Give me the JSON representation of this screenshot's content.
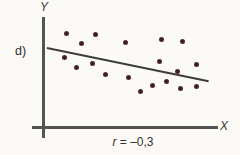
{
  "figure": {
    "panel_label": "d)",
    "y_axis_label": "Y",
    "x_axis_label": "X",
    "caption_variable": "r",
    "caption_rest": " = –0,3"
  },
  "chart_data": {
    "type": "scatter",
    "title": "",
    "xlabel": "X",
    "ylabel": "Y",
    "annotation": "r = –0,3",
    "correlation": -0.3,
    "axes_note": "axes are unlabeled (no ticks); point coordinates normalized 0–100 from the axis origin",
    "xlim": [
      0,
      100
    ],
    "ylim": [
      0,
      100
    ],
    "grid": false,
    "legend": false,
    "points": [
      {
        "x": 13,
        "y": 85
      },
      {
        "x": 22,
        "y": 76
      },
      {
        "x": 30,
        "y": 84
      },
      {
        "x": 47,
        "y": 77
      },
      {
        "x": 68,
        "y": 80
      },
      {
        "x": 80,
        "y": 78
      },
      {
        "x": 12,
        "y": 63
      },
      {
        "x": 19,
        "y": 54
      },
      {
        "x": 28,
        "y": 58
      },
      {
        "x": 36,
        "y": 48
      },
      {
        "x": 49,
        "y": 45
      },
      {
        "x": 56,
        "y": 33
      },
      {
        "x": 63,
        "y": 38
      },
      {
        "x": 67,
        "y": 60
      },
      {
        "x": 71,
        "y": 42
      },
      {
        "x": 77,
        "y": 51
      },
      {
        "x": 79,
        "y": 35
      },
      {
        "x": 88,
        "y": 57
      },
      {
        "x": 88,
        "y": 37
      }
    ],
    "trend_line": {
      "x1": 2,
      "y1": 72,
      "x2": 95,
      "y2": 42
    },
    "colors": {
      "point": "#4a2727",
      "axis": "#545454",
      "trend_line": "#3c3c3c",
      "text": "#333333",
      "background": "#fbfaf7"
    }
  }
}
